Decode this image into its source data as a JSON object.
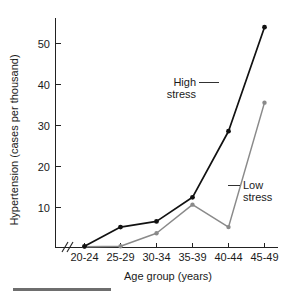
{
  "chart_data": {
    "type": "line",
    "title": "",
    "subtitle": "",
    "xlabel": "Age group (years)",
    "ylabel": "Hypertension (cases per thousand)",
    "categories": [
      "20-24",
      "25-29",
      "30-34",
      "35-39",
      "40-44",
      "45-49"
    ],
    "series": [
      {
        "name": "High stress",
        "color": "#111111",
        "values": [
          0.3,
          5.0,
          6.4,
          12.3,
          28.5,
          54.0
        ]
      },
      {
        "name": "Low stress",
        "color": "#8a8a8a",
        "values": [
          0.2,
          0.3,
          3.5,
          10.5,
          5.0,
          35.5
        ]
      }
    ],
    "ylim": [
      0,
      57
    ],
    "yticks": [
      10,
      20,
      30,
      40,
      50
    ],
    "ytick_labels": [
      "10",
      "20",
      "30",
      "40",
      "50"
    ],
    "grid": false,
    "legend": "none",
    "x_axis_break": true,
    "annotations": [
      {
        "id": "high-stress",
        "label_line1": "High",
        "label_line2": "stress",
        "points_to_series": "High stress"
      },
      {
        "id": "low-stress",
        "label_line1": "Low",
        "label_line2": "stress",
        "points_to_series": "Low stress"
      }
    ]
  },
  "axes": {
    "y_title": "Hypertension (cases per thousand)",
    "x_title": "Age group (years)"
  },
  "annotations": {
    "high": {
      "line1": "High",
      "line2": "stress"
    },
    "low": {
      "line1": "Low",
      "line2": "stress"
    }
  },
  "ticks": {
    "y": [
      "50",
      "40",
      "30",
      "20",
      "10"
    ],
    "x": [
      "20-24",
      "25-29",
      "30-34",
      "35-39",
      "40-44",
      "45-49"
    ]
  }
}
